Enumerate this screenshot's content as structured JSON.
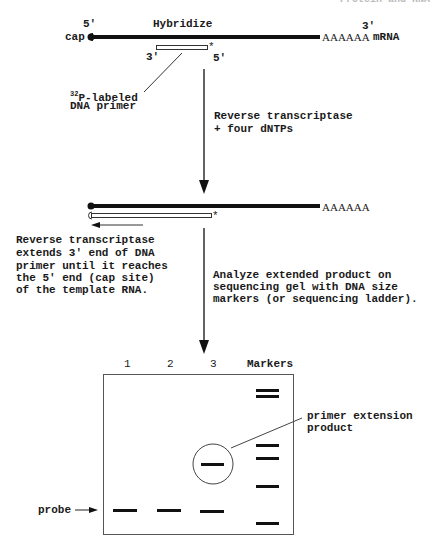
{
  "header_fragment": "Protein and RNA",
  "step1": {
    "five_prime": "5'",
    "cap": "cap",
    "title": "Hybridize",
    "three_prime": "3'",
    "polyA": "AAAAAA",
    "mrna": "mRNA",
    "primer_three": "3'",
    "primer_five": "5'",
    "primer_star": "*",
    "primer_label_sup": "32",
    "primer_label_line1": "P-labeled",
    "primer_label_line2": "DNA primer"
  },
  "arrow1_label": {
    "line1": "Reverse transcriptase",
    "line2": "+ four dNTPs"
  },
  "step2": {
    "polyA": "AAAAAA",
    "star": "*",
    "note_line1": "Reverse transcriptase",
    "note_line2": "extends 3' end of DNA",
    "note_line3": "primer until it reaches",
    "note_line4": "the 5' end (cap site)",
    "note_line5": "of the template RNA."
  },
  "arrow2_label": {
    "line1": "Analyze extended product on",
    "line2": "sequencing gel with DNA size",
    "line3": "markers (or sequencing ladder)."
  },
  "gel": {
    "lanes": [
      "1",
      "2",
      "3",
      "Markers"
    ],
    "probe_label": "probe",
    "product_label_line1": "primer extension",
    "product_label_line2": "product",
    "bands": {
      "lane1": [
        {
          "y": 510,
          "type": "probe"
        }
      ],
      "lane2": [
        {
          "y": 510,
          "type": "probe"
        }
      ],
      "lane3": [
        {
          "y": 464,
          "type": "extension-product"
        },
        {
          "y": 511,
          "type": "probe"
        }
      ],
      "markers": [
        390,
        396,
        445,
        458,
        486,
        523
      ]
    }
  }
}
